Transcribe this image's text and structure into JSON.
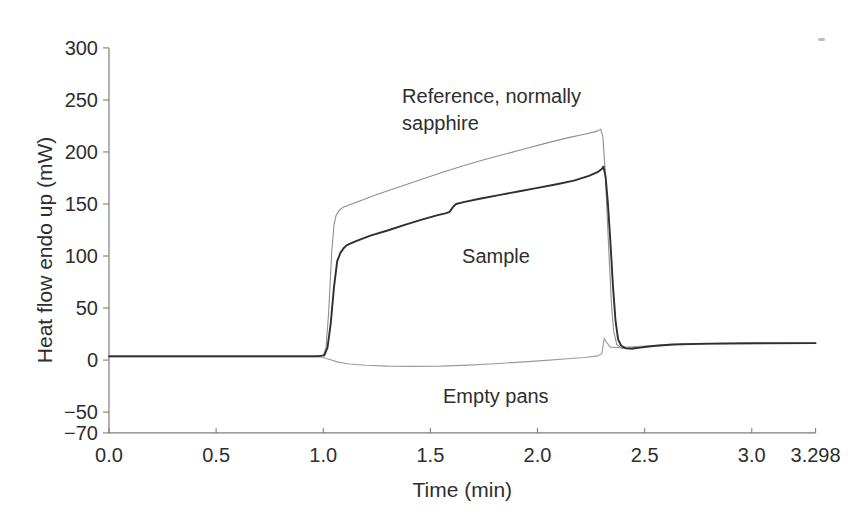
{
  "figure": {
    "background": "#ffffff",
    "text_color": "#2e2e2e",
    "axis_color": "#7d7d7d"
  },
  "chart_data": {
    "type": "line",
    "title": "",
    "xlabel": "Time (min)",
    "ylabel": "Heat flow endo up (mW)",
    "xlim": [
      0,
      3.298
    ],
    "ylim": [
      -70,
      300
    ],
    "grid": false,
    "legend_position": "none (inline text annotations)",
    "x_ticks": [
      {
        "v": 0,
        "label": "0.0"
      },
      {
        "v": 0.5,
        "label": "0.5"
      },
      {
        "v": 1.0,
        "label": "1.0"
      },
      {
        "v": 1.5,
        "label": "1.5"
      },
      {
        "v": 2.0,
        "label": "2.0"
      },
      {
        "v": 2.5,
        "label": "2.5"
      },
      {
        "v": 3.0,
        "label": "3.0"
      },
      {
        "v": 3.298,
        "label": "3.298"
      }
    ],
    "y_ticks": [
      {
        "v": 300,
        "label": "300"
      },
      {
        "v": 250,
        "label": "250"
      },
      {
        "v": 200,
        "label": "200"
      },
      {
        "v": 150,
        "label": "150"
      },
      {
        "v": 100,
        "label": "100"
      },
      {
        "v": 50,
        "label": "50"
      },
      {
        "v": 0,
        "label": "0"
      },
      {
        "v": -50,
        "label": "−50"
      },
      {
        "v": -70,
        "label": "−70"
      }
    ],
    "series": [
      {
        "name": "Reference, normally sapphire",
        "color": "#8f8f8f",
        "width": 1.1,
        "points": [
          [
            0,
            4
          ],
          [
            0.5,
            4
          ],
          [
            0.95,
            4
          ],
          [
            1.0,
            4.5
          ],
          [
            1.013,
            12
          ],
          [
            1.025,
            45
          ],
          [
            1.04,
            105
          ],
          [
            1.05,
            130
          ],
          [
            1.06,
            139
          ],
          [
            1.075,
            144
          ],
          [
            1.09,
            146.5
          ],
          [
            1.12,
            149
          ],
          [
            1.17,
            153
          ],
          [
            1.25,
            159
          ],
          [
            1.35,
            166
          ],
          [
            1.45,
            173
          ],
          [
            1.55,
            180
          ],
          [
            1.65,
            186.5
          ],
          [
            1.75,
            192.5
          ],
          [
            1.85,
            198
          ],
          [
            1.95,
            203.5
          ],
          [
            2.05,
            209
          ],
          [
            2.15,
            214
          ],
          [
            2.22,
            217
          ],
          [
            2.28,
            220
          ],
          [
            2.295,
            222
          ],
          [
            2.305,
            215
          ],
          [
            2.315,
            185
          ],
          [
            2.325,
            140
          ],
          [
            2.335,
            95
          ],
          [
            2.345,
            55
          ],
          [
            2.355,
            28
          ],
          [
            2.37,
            15
          ],
          [
            2.39,
            11.5
          ],
          [
            2.42,
            11
          ],
          [
            2.47,
            12.5
          ],
          [
            2.55,
            14
          ],
          [
            2.7,
            15.5
          ],
          [
            2.9,
            16
          ],
          [
            3.1,
            16.2
          ],
          [
            3.298,
            16.2
          ]
        ]
      },
      {
        "name": "Empty pans",
        "color": "#9b9b9b",
        "width": 1.1,
        "points": [
          [
            0,
            3.2
          ],
          [
            0.5,
            3.2
          ],
          [
            0.97,
            3.2
          ],
          [
            1.0,
            2.5
          ],
          [
            1.03,
            0.5
          ],
          [
            1.07,
            -2
          ],
          [
            1.12,
            -3.8
          ],
          [
            1.2,
            -5
          ],
          [
            1.3,
            -5.8
          ],
          [
            1.42,
            -6.1
          ],
          [
            1.55,
            -5.8
          ],
          [
            1.68,
            -4.8
          ],
          [
            1.8,
            -3.5
          ],
          [
            1.92,
            -2
          ],
          [
            2.04,
            -0.3
          ],
          [
            2.14,
            1.2
          ],
          [
            2.22,
            2.5
          ],
          [
            2.28,
            4
          ],
          [
            2.3,
            6
          ],
          [
            2.312,
            21
          ],
          [
            2.322,
            17
          ],
          [
            2.34,
            12.5
          ],
          [
            2.38,
            12
          ],
          [
            2.44,
            12.8
          ],
          [
            2.52,
            13.8
          ],
          [
            2.62,
            14.8
          ],
          [
            2.75,
            15.5
          ],
          [
            2.95,
            15.8
          ],
          [
            3.298,
            16
          ]
        ]
      },
      {
        "name": "Sample",
        "color": "#2f2f2f",
        "width": 1.9,
        "points": [
          [
            0,
            3.5
          ],
          [
            0.5,
            3.5
          ],
          [
            0.97,
            3.5
          ],
          [
            1.005,
            4.5
          ],
          [
            1.02,
            12
          ],
          [
            1.035,
            35
          ],
          [
            1.05,
            70
          ],
          [
            1.065,
            95
          ],
          [
            1.08,
            103
          ],
          [
            1.095,
            107.5
          ],
          [
            1.11,
            110.5
          ],
          [
            1.15,
            114
          ],
          [
            1.22,
            119.5
          ],
          [
            1.3,
            124.5
          ],
          [
            1.38,
            130
          ],
          [
            1.46,
            135
          ],
          [
            1.53,
            139
          ],
          [
            1.57,
            141
          ],
          [
            1.59,
            142.5
          ],
          [
            1.605,
            147
          ],
          [
            1.62,
            150
          ],
          [
            1.66,
            152
          ],
          [
            1.73,
            155
          ],
          [
            1.82,
            158.5
          ],
          [
            1.91,
            162
          ],
          [
            2.0,
            165.5
          ],
          [
            2.09,
            169
          ],
          [
            2.17,
            172.5
          ],
          [
            2.24,
            177
          ],
          [
            2.28,
            180.5
          ],
          [
            2.3,
            183.5
          ],
          [
            2.308,
            186
          ],
          [
            2.318,
            176
          ],
          [
            2.328,
            152
          ],
          [
            2.34,
            115
          ],
          [
            2.352,
            72
          ],
          [
            2.364,
            38
          ],
          [
            2.376,
            20
          ],
          [
            2.39,
            14
          ],
          [
            2.41,
            11.5
          ],
          [
            2.44,
            10.8
          ],
          [
            2.48,
            12
          ],
          [
            2.54,
            13.5
          ],
          [
            2.63,
            15
          ],
          [
            2.8,
            15.8
          ],
          [
            3.0,
            16.2
          ],
          [
            3.298,
            16.3
          ]
        ]
      }
    ],
    "annotations": [
      {
        "id": "reference-label",
        "lines": [
          "Reference, normally",
          "sapphire"
        ],
        "t": 1.368,
        "mw": 247
      },
      {
        "id": "sample-label",
        "lines": [
          "Sample"
        ],
        "t": 1.648,
        "mw": 93
      },
      {
        "id": "empty-pans-label",
        "lines": [
          "Empty pans"
        ],
        "t": 1.559,
        "mw": -41
      }
    ],
    "artifact_speck": {
      "x": 818,
      "y": 38,
      "w": 7,
      "h": 3,
      "color": "#b7b2ac"
    }
  }
}
